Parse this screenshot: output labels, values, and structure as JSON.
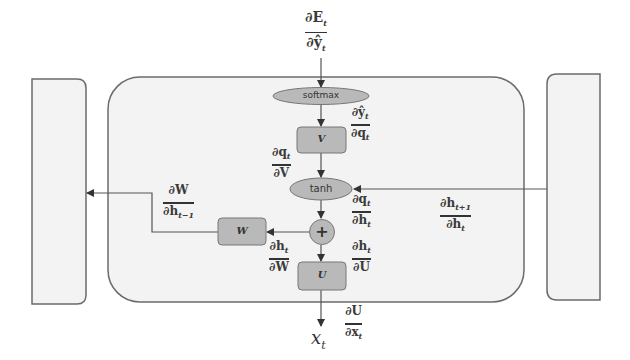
{
  "diagram": {
    "colors": {
      "container_fill": "#f3f3f3",
      "container_stroke": "#6b6b6b",
      "node_fill": "#b9b9b9",
      "node_stroke": "#777777",
      "arrow": "#444444"
    },
    "nodes": {
      "softmax": "softmax",
      "v": "V",
      "tanh": "tanh",
      "plus": "+",
      "w": "W",
      "u": "U"
    },
    "input_label": {
      "base": "x",
      "sub": "t"
    },
    "gradients": {
      "dE_dyhat": {
        "num": "∂E",
        "num_sub": "t",
        "den": "∂ŷ",
        "den_sub": "t"
      },
      "dyhat_dq": {
        "num": "∂ŷ",
        "num_sub": "t",
        "den": "∂q",
        "den_sub": "t"
      },
      "dq_dV": {
        "num": "∂q",
        "num_sub": "t",
        "den": "∂V",
        "den_sub": ""
      },
      "dq_dh": {
        "num": "∂q",
        "num_sub": "t",
        "den": "∂h",
        "den_sub": "t"
      },
      "dhnext_dh": {
        "num": "∂h",
        "num_sub": "t+1",
        "den": "∂h",
        "den_sub": "t"
      },
      "dW_dhprev": {
        "num": "∂W",
        "num_sub": "",
        "den": "∂h",
        "den_sub": "t−1"
      },
      "dh_dW": {
        "num": "∂h",
        "num_sub": "t",
        "den": "∂W",
        "den_sub": ""
      },
      "dh_dU": {
        "num": "∂h",
        "num_sub": "t",
        "den": "∂U",
        "den_sub": ""
      },
      "dU_dx": {
        "num": "∂U",
        "num_sub": "",
        "den": "∂x",
        "den_sub": "t"
      }
    }
  }
}
